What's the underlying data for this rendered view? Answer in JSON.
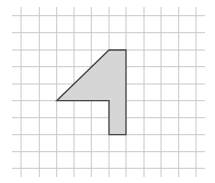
{
  "diagram": {
    "grid": {
      "columns_x": [
        21,
        39.3,
        56.7,
        74,
        91.3,
        109,
        126,
        144,
        161,
        178.7,
        196
      ],
      "rows_y": [
        15.7,
        32.7,
        50,
        66.7,
        84,
        100.7,
        117.7,
        134.7,
        151.7,
        168.3
      ],
      "x_extent": [
        12,
        205
      ],
      "y_extent": [
        7,
        177
      ],
      "line_color": "#c8c8c8"
    },
    "shape": {
      "points": "109,50 126,50 126,134.7 109,134.7 109,100.7 56.7,100.7",
      "fill": "#d6d6d6",
      "stroke": "#444444"
    }
  }
}
